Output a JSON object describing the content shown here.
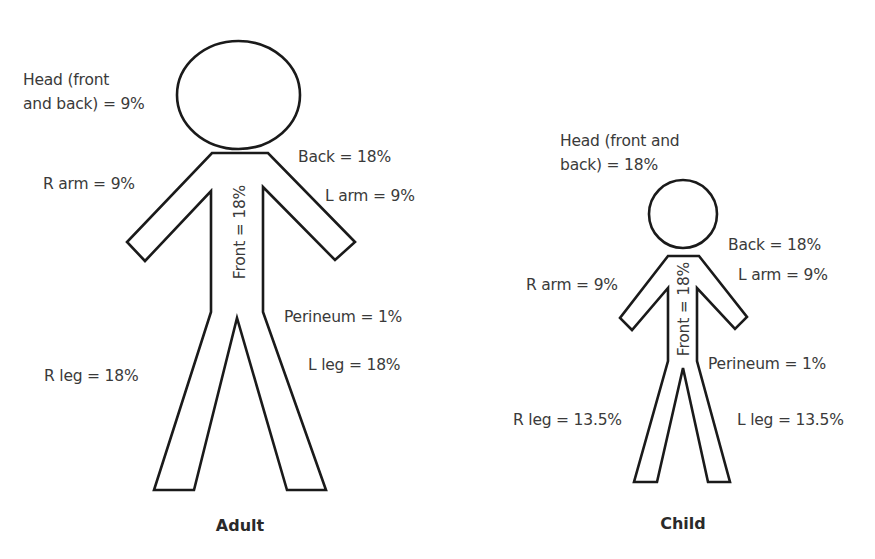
{
  "diagram": {
    "figures": [
      {
        "id": "adult",
        "caption": "Adult",
        "labels": {
          "head_line1": "Head (front",
          "head_line2": "and back) = 9%",
          "r_arm": "R arm = 9%",
          "back": "Back = 18%",
          "l_arm": "L arm = 9%",
          "front": "Front = 18%",
          "perineum": "Perineum = 1%",
          "l_leg": "L leg = 18%",
          "r_leg": "R leg = 18%"
        },
        "values": {
          "head": 9,
          "r_arm": 9,
          "l_arm": 9,
          "back": 18,
          "front": 18,
          "perineum": 1,
          "r_leg": 18,
          "l_leg": 18
        }
      },
      {
        "id": "child",
        "caption": "Child",
        "labels": {
          "head_line1": "Head (front and",
          "head_line2": "back) = 18%",
          "r_arm": "R arm = 9%",
          "back": "Back = 18%",
          "l_arm": "L arm = 9%",
          "front": "Front = 18%",
          "perineum": "Perineum = 1%",
          "l_leg": "L leg = 13.5%",
          "r_leg": "R leg = 13.5%"
        },
        "values": {
          "head": 18,
          "r_arm": 9,
          "l_arm": 9,
          "back": 18,
          "front": 18,
          "perineum": 1,
          "r_leg": 13.5,
          "l_leg": 13.5
        }
      }
    ],
    "colors": {
      "outline": "#1a1a1a",
      "text": "#3a3a3a",
      "background": "#ffffff"
    }
  }
}
